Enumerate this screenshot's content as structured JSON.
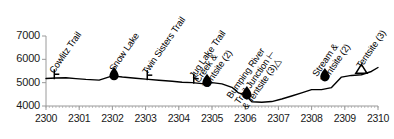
{
  "chart_data": {
    "type": "line",
    "title": "",
    "xlabel": "",
    "ylabel": "",
    "xlim": [
      2300,
      2310
    ],
    "ylim": [
      4000,
      7000
    ],
    "grid": false,
    "legend": null,
    "x_ticks": [
      "2300",
      "2301",
      "2302",
      "2303",
      "2304",
      "2305",
      "2306",
      "2307",
      "2308",
      "2309",
      "2310"
    ],
    "y_ticks": [
      "4000",
      "5000",
      "6000",
      "7000"
    ],
    "series": [
      {
        "name": "elevation",
        "x": [
          2300.0,
          2300.3,
          2300.6,
          2300.9,
          2301.2,
          2301.6,
          2302.0,
          2302.3,
          2302.7,
          2303.0,
          2303.4,
          2303.8,
          2304.1,
          2304.4,
          2304.7,
          2305.0,
          2305.3,
          2305.6,
          2305.8,
          2306.0,
          2306.2,
          2306.5,
          2306.8,
          2307.1,
          2307.4,
          2307.7,
          2308.0,
          2308.3,
          2308.6,
          2308.9,
          2309.2,
          2309.5,
          2309.8,
          2310.0
        ],
        "y": [
          5180,
          5200,
          5210,
          5175,
          5140,
          5110,
          5290,
          5240,
          5190,
          5150,
          5105,
          5060,
          5020,
          5000,
          4960,
          5000,
          4950,
          4800,
          4560,
          4470,
          4180,
          4160,
          4190,
          4300,
          4430,
          4560,
          4700,
          4700,
          4790,
          5240,
          5310,
          5340,
          5480,
          5650
        ]
      }
    ],
    "annotations": [
      {
        "label": "Cowlitz Trail",
        "x": 2300.25,
        "marker": "trail-junction",
        "marker_y": 5190
      },
      {
        "label": "Snow Lake",
        "x": 2302.05,
        "marker": "water",
        "marker_y": 5290
      },
      {
        "label": "Twin Sisters Trail",
        "x": 2303.05,
        "marker": "trail-junction",
        "marker_y": 5150
      },
      {
        "label": "Jug Lake Trail",
        "x": 2304.45,
        "marker": "trail-junction",
        "marker_y": 5000
      },
      {
        "label": "Creek &\nTentsite (2)",
        "x": 2304.85,
        "marker": "water",
        "marker_y": 5000
      },
      {
        "label": "Bumping River\nTrail Junction ⊢\n& Tentsite (3)△",
        "x": 2306.05,
        "marker": "water",
        "marker_y": 4470
      },
      {
        "label": "Stream &\nTentsite (2)",
        "x": 2308.4,
        "marker": "water",
        "marker_y": 5240
      },
      {
        "label": "Tentsite (3)",
        "x": 2309.5,
        "marker": "tentsite",
        "marker_y": 5400
      }
    ]
  },
  "colors": {
    "line": "#000000",
    "axis": "#9a9a9a",
    "text": "#1a1a1a",
    "marker": "#000000"
  }
}
